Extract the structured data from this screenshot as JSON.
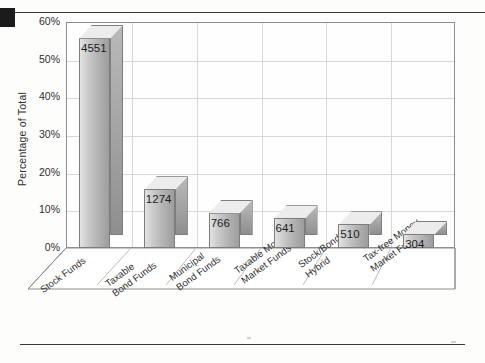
{
  "chart_data": {
    "type": "bar",
    "title": "",
    "subtitle": "",
    "xlabel": "",
    "ylabel": "Percentage of Total",
    "ylim": [
      0,
      60
    ],
    "ytick_labels": [
      "0%",
      "10%",
      "20%",
      "30%",
      "40%",
      "50%",
      "60%"
    ],
    "ytick_values": [
      0,
      10,
      20,
      30,
      40,
      50,
      60
    ],
    "grid": true,
    "legend": "none",
    "three_d": true,
    "categories": [
      "Stock Funds",
      "Taxable Bond Funds",
      "Municipal Bond Funds",
      "Taxable Money Market Funds",
      "Stock/Bond Hybrid",
      "Tax-free Money Market Funds"
    ],
    "category_lines": [
      [
        "Stock Funds"
      ],
      [
        "Taxable",
        "Bond Funds"
      ],
      [
        "Municipal",
        "Bond Funds"
      ],
      [
        "Taxable Money",
        "Market Funds"
      ],
      [
        "Stock/Bond",
        "Hybrid"
      ],
      [
        "Tax-free Money",
        "Market Funds"
      ]
    ],
    "data_labels": [
      "4551",
      "1274",
      "766",
      "641",
      "510",
      "304"
    ],
    "counts": [
      4551,
      1274,
      766,
      641,
      510,
      304
    ],
    "values": [
      55.8,
      15.6,
      9.4,
      7.9,
      6.3,
      3.7
    ],
    "value_unit": "percent"
  },
  "colors": {
    "bar_light": "#e3e3e3",
    "bar_dark": "#9d9d9d",
    "bar_top": "#ececec",
    "outline": "#7d7d7d",
    "grid": "#d8d8d8",
    "frame": "#8e8e8e",
    "text": "#2e2e2e",
    "rule": "#3a3a3a",
    "marker_block": "#1b1b1b"
  }
}
